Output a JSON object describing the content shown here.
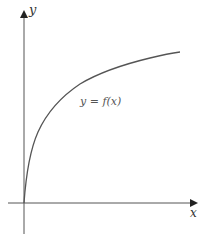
{
  "figure": {
    "type": "function-graph",
    "axes": {
      "x_label": "x",
      "y_label": "y"
    },
    "curve": {
      "label": "y = f(x)",
      "shape": "increasing, concave down, starts at origin (square-root / log-like)",
      "color": "#555555"
    },
    "colors": {
      "axis": "#444444",
      "background": "#ffffff"
    }
  }
}
